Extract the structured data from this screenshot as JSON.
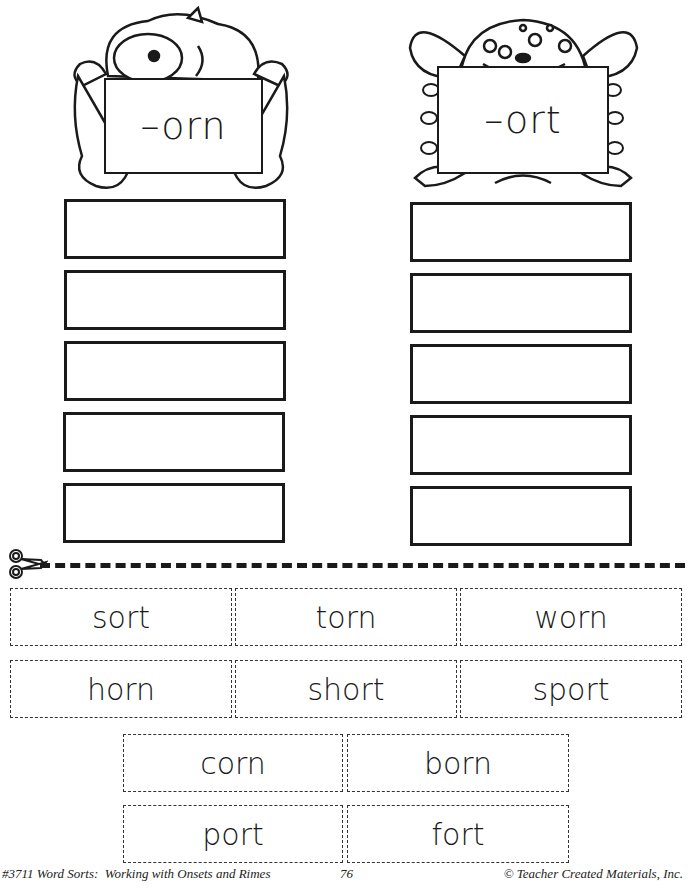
{
  "left_column": {
    "rime": "–orn",
    "icon": "furry-one-eyed-monster",
    "answer_box_count": 5
  },
  "right_column": {
    "rime": "–ort",
    "icon": "multi-eyed-goblin-monster",
    "answer_box_count": 5
  },
  "cut_line": {
    "icon": "scissors-icon"
  },
  "word_cards": {
    "row1": [
      "sort",
      "torn",
      "worn"
    ],
    "row2": [
      "horn",
      "short",
      "sport"
    ],
    "row3": [
      "corn",
      "born"
    ],
    "row4": [
      "port",
      "fort"
    ]
  },
  "footer": {
    "left": "#3711 Word Sorts:  Working with Onsets and Rimes",
    "page_number": "76",
    "right": "© Teacher Created Materials, Inc."
  }
}
